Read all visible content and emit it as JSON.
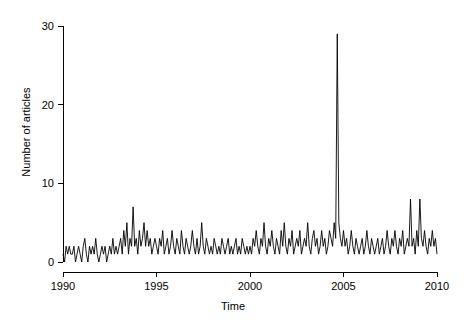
{
  "chart_data": {
    "type": "line",
    "title": "",
    "xlabel": "Time",
    "ylabel": "Number of articles",
    "xlim": [
      1990.0,
      2010.0
    ],
    "ylim": [
      0,
      30
    ],
    "xticks": [
      1990,
      1995,
      2000,
      2005,
      2010
    ],
    "yticks": [
      0,
      10,
      20,
      30
    ],
    "grid": false,
    "legend": "none",
    "series": [
      {
        "name": "Number of articles",
        "x_start": 1990.0,
        "x_step": 0.0833333,
        "values": [
          1,
          0,
          2,
          1,
          2,
          1,
          1,
          2,
          0,
          1,
          2,
          1,
          0,
          2,
          3,
          1,
          0,
          2,
          1,
          2,
          1,
          3,
          1,
          0,
          1,
          2,
          1,
          2,
          0,
          1,
          2,
          1,
          3,
          1,
          2,
          1,
          2,
          3,
          1,
          4,
          2,
          5,
          1,
          3,
          2,
          7,
          2,
          3,
          1,
          4,
          2,
          3,
          5,
          2,
          4,
          2,
          3,
          1,
          2,
          3,
          2,
          1,
          3,
          2,
          4,
          1,
          2,
          3,
          1,
          2,
          4,
          2,
          1,
          3,
          2,
          1,
          4,
          2,
          1,
          3,
          2,
          1,
          2,
          4,
          2,
          1,
          3,
          1,
          2,
          5,
          2,
          1,
          3,
          2,
          1,
          2,
          1,
          3,
          2,
          1,
          2,
          1,
          3,
          2,
          1,
          2,
          3,
          1,
          2,
          1,
          2,
          3,
          1,
          2,
          1,
          3,
          2,
          1,
          2,
          1,
          2,
          1,
          3,
          2,
          4,
          2,
          1,
          3,
          2,
          5,
          2,
          1,
          3,
          2,
          4,
          2,
          1,
          3,
          2,
          1,
          4,
          2,
          5,
          2,
          1,
          3,
          2,
          4,
          1,
          2,
          3,
          2,
          4,
          1,
          2,
          3,
          2,
          5,
          2,
          1,
          3,
          4,
          2,
          3,
          1,
          2,
          4,
          2,
          3,
          1,
          2,
          4,
          3,
          2,
          5,
          3,
          29,
          5,
          3,
          2,
          4,
          2,
          3,
          1,
          2,
          4,
          2,
          1,
          3,
          2,
          1,
          2,
          3,
          1,
          2,
          4,
          2,
          1,
          3,
          2,
          1,
          2,
          3,
          1,
          2,
          3,
          1,
          2,
          4,
          2,
          1,
          3,
          2,
          4,
          2,
          1,
          3,
          2,
          4,
          1,
          2,
          3,
          2,
          8,
          2,
          3,
          1,
          4,
          2,
          8,
          3,
          2,
          4,
          2,
          1,
          3,
          2,
          4,
          2,
          3,
          1,
          2,
          4,
          23,
          4,
          16,
          3,
          6,
          2,
          1,
          6,
          1
        ]
      }
    ],
    "annotations": [
      {
        "label": "peak-2002",
        "x": 2002.5,
        "y": 29
      },
      {
        "label": "peak-2009",
        "x": 2009.25,
        "y": 23
      },
      {
        "label": "peak-2009b",
        "x": 2009.45,
        "y": 16
      }
    ]
  },
  "axes": {
    "x_tick_labels": [
      "1990",
      "1995",
      "2000",
      "2005",
      "2010"
    ],
    "y_tick_labels": [
      "0",
      "10",
      "20",
      "30"
    ],
    "x_title": "Time",
    "y_title": "Number of articles"
  },
  "style": {
    "line_color": "#000000",
    "axis_color": "#000000",
    "background": "#ffffff"
  }
}
